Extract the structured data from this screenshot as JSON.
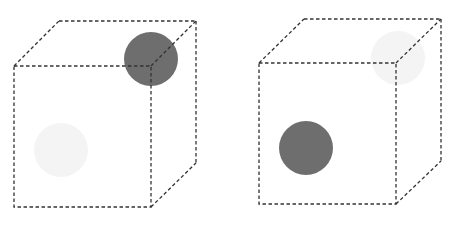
{
  "diagram": {
    "colors": {
      "edge": "#333333",
      "dark_sphere": "#6e6e6e",
      "faint_sphere": "#f4f4f4",
      "background": "#ffffff"
    },
    "cubes": [
      {
        "id": "left",
        "dark_sphere": {
          "position": "back-top-right corner",
          "cx": 151,
          "cy": 59,
          "r": 27
        },
        "faint_sphere": {
          "position": "front-bottom-left",
          "cx": 61,
          "cy": 150,
          "r": 27
        }
      },
      {
        "id": "right",
        "dark_sphere": {
          "position": "front-bottom-left",
          "cx": 306,
          "cy": 148,
          "r": 27
        },
        "faint_sphere": {
          "position": "back-top-right corner",
          "cx": 398,
          "cy": 58,
          "r": 27
        }
      }
    ]
  }
}
